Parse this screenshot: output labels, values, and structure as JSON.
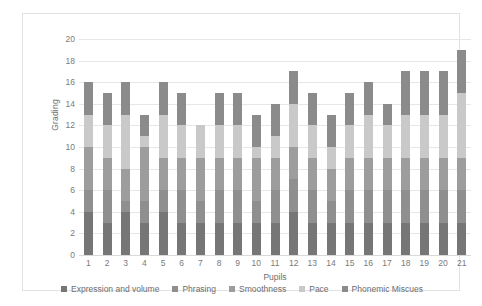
{
  "chart_data": {
    "type": "bar",
    "stacked": true,
    "title": "",
    "xlabel": "Pupils",
    "ylabel": "Grading",
    "ylim": [
      0,
      20
    ],
    "ytick_step": 2,
    "yticks": [
      0,
      2,
      4,
      6,
      8,
      10,
      12,
      14,
      16,
      18,
      20
    ],
    "grid": true,
    "legend_position": "bottom",
    "categories": [
      "1",
      "2",
      "3",
      "4",
      "5",
      "6",
      "7",
      "8",
      "9",
      "10",
      "11",
      "12",
      "13",
      "14",
      "15",
      "16",
      "17",
      "18",
      "19",
      "20",
      "21"
    ],
    "series": [
      {
        "name": "Expression and volume",
        "color": "#767676",
        "values": [
          4,
          3,
          4,
          3,
          4,
          3,
          3,
          3,
          3,
          3,
          3,
          4,
          3,
          3,
          3,
          3,
          3,
          3,
          3,
          3,
          3
        ]
      },
      {
        "name": "Phrasing",
        "color": "#8f8f8f",
        "values": [
          2,
          3,
          1,
          2,
          2,
          3,
          2,
          3,
          3,
          2,
          3,
          3,
          3,
          2,
          3,
          3,
          3,
          3,
          3,
          3,
          3
        ]
      },
      {
        "name": "Smoothness",
        "color": "#9d9d9d",
        "values": [
          4,
          3,
          3,
          5,
          3,
          3,
          4,
          3,
          3,
          4,
          3,
          3,
          3,
          3,
          3,
          3,
          3,
          3,
          3,
          3,
          3
        ]
      },
      {
        "name": "Pace",
        "color": "#c9c9c9",
        "values": [
          3,
          3,
          5,
          1,
          4,
          3,
          3,
          3,
          3,
          1,
          2,
          4,
          3,
          2,
          3,
          4,
          3,
          4,
          4,
          4,
          6
        ]
      },
      {
        "name": "Phonemic Miscues",
        "color": "#8b8b8b",
        "values": [
          3,
          3,
          3,
          2,
          3,
          3,
          0,
          3,
          3,
          3,
          3,
          3,
          3,
          3,
          3,
          3,
          2,
          4,
          4,
          4,
          4
        ]
      }
    ],
    "totals": [
      16,
      15,
      16,
      13,
      16,
      15,
      12,
      15,
      15,
      13,
      14,
      17,
      15,
      13,
      15,
      16,
      14,
      17,
      17,
      17,
      19
    ]
  },
  "axes": {
    "y_title": "Grading",
    "x_title": "Pupils"
  },
  "colors": {
    "background": "#ffffff",
    "frame_border": "#e2e2e2",
    "gridline": "#e7e7e7",
    "tick_text": "#7a7a7a",
    "axis_title_text": "#6d6d6d"
  }
}
